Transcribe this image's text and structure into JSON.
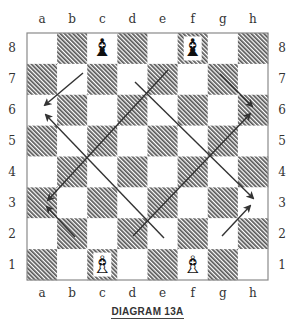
{
  "board": {
    "left": 27,
    "top": 33,
    "width": 241,
    "height": 247,
    "files": [
      "a",
      "b",
      "c",
      "d",
      "e",
      "f",
      "g",
      "h"
    ],
    "ranks": [
      "8",
      "7",
      "6",
      "5",
      "4",
      "3",
      "2",
      "1"
    ],
    "light_color": "#ffffff",
    "dark_color": "#6e6e6e",
    "border_color": "#8a8a8a"
  },
  "pieces": [
    {
      "square": "c8",
      "piece": "bishop",
      "color": "black",
      "glyph": "♝"
    },
    {
      "square": "f8",
      "piece": "bishop",
      "color": "black",
      "glyph": "♝"
    },
    {
      "square": "c1",
      "piece": "bishop",
      "color": "white",
      "glyph": "♗"
    },
    {
      "square": "f1",
      "piece": "bishop",
      "color": "white",
      "glyph": "♗"
    }
  ],
  "arrows": [
    {
      "from": "c7",
      "to": "a6",
      "x1": 83,
      "y1": 73,
      "x2": 45,
      "y2": 105
    },
    {
      "from": "e2",
      "to": "a6",
      "x1": 164,
      "y1": 238,
      "x2": 46,
      "y2": 115
    },
    {
      "from": "e7",
      "to": "a3",
      "x1": 168,
      "y1": 70,
      "x2": 48,
      "y2": 200
    },
    {
      "from": "b2",
      "to": "a3",
      "x1": 75,
      "y1": 237,
      "x2": 47,
      "y2": 207
    },
    {
      "from": "d7",
      "to": "h3",
      "x1": 135,
      "y1": 82,
      "x2": 253,
      "y2": 198
    },
    {
      "from": "g7",
      "to": "h6",
      "x1": 220,
      "y1": 74,
      "x2": 252,
      "y2": 106
    },
    {
      "from": "d2",
      "to": "h6",
      "x1": 133,
      "y1": 236,
      "x2": 250,
      "y2": 114
    },
    {
      "from": "g2",
      "to": "h3",
      "x1": 222,
      "y1": 236,
      "x2": 250,
      "y2": 206
    }
  ],
  "caption": "DIAGRAM 13A"
}
